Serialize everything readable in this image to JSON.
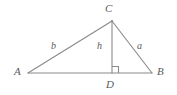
{
  "figure": {
    "kind": "geometry-diagram",
    "background_color": "#ffffff",
    "stroke_color": "#8a8a8a",
    "label_color": "#5a5a5a",
    "vertices": {
      "A": {
        "label": "A",
        "x": 28,
        "y": 73
      },
      "B": {
        "label": "B",
        "x": 152,
        "y": 73
      },
      "C": {
        "label": "C",
        "x": 112,
        "y": 21
      },
      "D": {
        "label": "D",
        "x": 112,
        "y": 73
      }
    },
    "sides": {
      "a": {
        "label": "a",
        "from": "C",
        "to": "B"
      },
      "b": {
        "label": "b",
        "from": "A",
        "to": "C"
      },
      "h": {
        "label": "h",
        "from": "C",
        "to": "D"
      }
    },
    "right_angle": {
      "at": "D",
      "marker": "square",
      "size": 6
    }
  }
}
